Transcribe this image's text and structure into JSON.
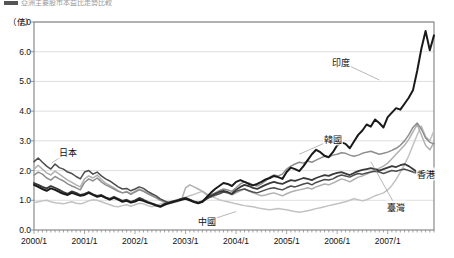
{
  "header": {
    "cut_title": "亞洲主要股市本益比走勢比較"
  },
  "chart_data": {
    "type": "line",
    "title": "",
    "unit_label": "（倍）",
    "xlabel": "",
    "ylabel": "倍",
    "ylim": [
      0.0,
      7.0
    ],
    "yticks": [
      "0.0",
      "1.0",
      "2.0",
      "3.0",
      "4.0",
      "5.0",
      "6.0",
      "7.0"
    ],
    "ytick_values": [
      0.0,
      1.0,
      2.0,
      3.0,
      4.0,
      5.0,
      6.0,
      7.0
    ],
    "xticks": [
      "2000/1",
      "2001/1",
      "2002/1",
      "2003/1",
      "2004/1",
      "2005/1",
      "2006/1",
      "2007/1"
    ],
    "xtick_values": [
      0,
      12,
      24,
      36,
      48,
      60,
      72,
      84
    ],
    "x_range": [
      0,
      95
    ],
    "x_minor_tick_interval_months": 1,
    "grid": "horizontal",
    "legend": "inline-annotations",
    "colors": {
      "japan": "#4d4d4d",
      "china": "#c2c2c2",
      "korea": "#8e8e8e",
      "hongkong": "#3a3a3a",
      "taiwan": "#b0b0b0",
      "india": "#1a1a1a",
      "axis": "#808080",
      "grid": "#d6d6d6",
      "text": "#111111"
    },
    "series": [
      {
        "name": "日本",
        "key": "japan",
        "color": "#4d4d4d",
        "width": 1.5,
        "label_x_month": 8,
        "label_y_value": 2.62,
        "leader_to_x_month": 4.2,
        "leader_to_y_value": 2.25,
        "values": [
          2.3,
          2.42,
          2.28,
          2.15,
          2.05,
          2.22,
          2.1,
          2.05,
          1.95,
          1.9,
          1.8,
          1.72,
          1.95,
          2.0,
          1.88,
          1.95,
          1.82,
          1.72,
          1.65,
          1.55,
          1.45,
          1.38,
          1.4,
          1.32,
          1.38,
          1.45,
          1.4,
          1.3,
          1.22,
          1.15,
          1.05,
          0.98,
          0.92,
          0.98,
          1.0,
          1.05,
          1.08,
          1.02,
          0.95,
          0.92,
          0.98,
          1.05,
          1.12,
          1.18,
          1.22,
          1.28,
          1.25,
          1.2,
          1.3,
          1.35,
          1.38,
          1.32,
          1.28,
          1.25,
          1.3,
          1.35,
          1.4,
          1.42,
          1.38,
          1.35,
          1.42,
          1.48,
          1.45,
          1.5,
          1.55,
          1.58,
          1.52,
          1.6,
          1.65,
          1.7,
          1.68,
          1.72,
          1.8,
          1.85,
          1.82,
          1.78,
          1.85,
          1.9,
          1.88,
          1.92,
          1.95,
          1.98,
          1.95,
          1.9,
          1.95,
          2.0,
          1.98,
          2.02,
          2.05,
          2.0,
          1.95,
          1.92,
          1.9,
          1.95,
          1.98,
          2.0
        ]
      },
      {
        "name": "中國",
        "key": "china",
        "color": "#c2c2c2",
        "width": 1.5,
        "label_x_month": 41,
        "label_y_value": 0.3,
        "leader_to_x_month": 48,
        "leader_to_y_value": 0.62,
        "values": [
          0.92,
          0.95,
          0.98,
          1.0,
          0.95,
          0.92,
          0.9,
          0.88,
          0.92,
          0.95,
          0.9,
          0.88,
          0.92,
          0.98,
          1.02,
          1.0,
          0.95,
          0.9,
          0.85,
          0.8,
          0.78,
          0.82,
          0.85,
          0.8,
          0.85,
          0.9,
          0.88,
          0.82,
          0.78,
          0.82,
          0.88,
          0.92,
          0.95,
          0.98,
          1.02,
          1.05,
          1.1,
          1.15,
          1.2,
          1.25,
          1.3,
          1.22,
          1.15,
          1.08,
          1.02,
          0.98,
          0.95,
          0.92,
          0.88,
          0.85,
          0.82,
          0.8,
          0.78,
          0.75,
          0.72,
          0.7,
          0.68,
          0.7,
          0.72,
          0.7,
          0.68,
          0.65,
          0.62,
          0.6,
          0.62,
          0.65,
          0.68,
          0.72,
          0.75,
          0.78,
          0.82,
          0.85,
          0.88,
          0.92,
          0.95,
          1.0,
          1.05,
          1.02,
          0.98,
          1.02,
          1.08,
          1.15,
          1.2,
          1.25,
          1.35,
          1.5,
          1.7,
          1.95,
          2.2,
          2.5,
          2.85,
          3.2,
          3.5,
          3.15,
          3.0,
          3.35
        ]
      },
      {
        "name": "韓國",
        "key": "korea",
        "color": "#8e8e8e",
        "width": 1.5,
        "label_x_month": 71,
        "label_y_value": 3.05,
        "leader_to_x_month": 63,
        "leader_to_y_value": 2.55,
        "values": [
          1.85,
          1.95,
          1.88,
          1.75,
          1.68,
          1.8,
          1.72,
          1.65,
          1.55,
          1.48,
          1.42,
          1.35,
          1.6,
          1.72,
          1.65,
          1.75,
          1.62,
          1.52,
          1.45,
          1.38,
          1.3,
          1.25,
          1.28,
          1.2,
          1.28,
          1.35,
          1.3,
          1.22,
          1.15,
          1.08,
          1.0,
          0.95,
          0.9,
          0.95,
          0.98,
          1.02,
          1.05,
          1.0,
          0.95,
          0.92,
          0.98,
          1.08,
          1.18,
          1.25,
          1.32,
          1.38,
          1.35,
          1.3,
          1.42,
          1.55,
          1.62,
          1.58,
          1.52,
          1.48,
          1.55,
          1.65,
          1.78,
          1.85,
          1.82,
          1.88,
          2.05,
          2.15,
          2.22,
          2.28,
          2.25,
          2.32,
          2.28,
          2.35,
          2.42,
          2.48,
          2.45,
          2.52,
          2.55,
          2.6,
          2.58,
          2.52,
          2.48,
          2.52,
          2.58,
          2.62,
          2.65,
          2.6,
          2.55,
          2.58,
          2.62,
          2.68,
          2.75,
          2.85,
          3.0,
          3.2,
          3.45,
          3.6,
          3.4,
          3.1,
          2.95,
          2.9
        ]
      },
      {
        "name": "香港",
        "key": "hongkong",
        "color": "#3a3a3a",
        "width": 1.8,
        "label_x_month": 93,
        "label_y_value": 1.9,
        "leader_to_x_month": 90,
        "leader_to_y_value": 1.92,
        "values": [
          1.58,
          1.52,
          1.45,
          1.4,
          1.48,
          1.42,
          1.35,
          1.28,
          1.22,
          1.3,
          1.25,
          1.18,
          1.22,
          1.28,
          1.2,
          1.15,
          1.18,
          1.1,
          1.05,
          1.12,
          1.05,
          0.98,
          1.02,
          0.95,
          1.0,
          1.08,
          1.02,
          0.95,
          0.9,
          0.85,
          0.8,
          0.88,
          0.92,
          0.95,
          1.0,
          1.05,
          1.08,
          1.02,
          0.96,
          0.92,
          0.95,
          1.05,
          1.15,
          1.22,
          1.28,
          1.32,
          1.28,
          1.22,
          1.35,
          1.45,
          1.52,
          1.48,
          1.42,
          1.38,
          1.45,
          1.52,
          1.58,
          1.62,
          1.58,
          1.55,
          1.62,
          1.68,
          1.65,
          1.7,
          1.75,
          1.72,
          1.68,
          1.75,
          1.8,
          1.85,
          1.82,
          1.88,
          1.92,
          1.95,
          1.9,
          1.85,
          1.92,
          1.98,
          2.02,
          2.05,
          2.08,
          2.05,
          2.0,
          2.05,
          2.1,
          2.15,
          2.12,
          2.18,
          2.22,
          2.15,
          2.05,
          1.95,
          1.9,
          1.92,
          1.95,
          1.98
        ]
      },
      {
        "name": "臺灣",
        "key": "taiwan",
        "color": "#b0b0b0",
        "width": 1.5,
        "label_x_month": 86,
        "label_y_value": 0.78,
        "leader_to_x_month": 80,
        "leader_to_y_value": 2.3,
        "values": [
          2.05,
          2.18,
          2.05,
          1.92,
          1.85,
          1.98,
          1.88,
          1.78,
          1.68,
          1.6,
          1.52,
          1.45,
          1.72,
          1.82,
          1.75,
          1.85,
          1.7,
          1.58,
          1.5,
          1.42,
          1.32,
          1.25,
          1.3,
          1.22,
          1.3,
          1.38,
          1.32,
          1.25,
          1.18,
          1.1,
          1.02,
          0.95,
          0.88,
          0.92,
          0.95,
          1.0,
          1.42,
          1.52,
          1.45,
          1.38,
          1.3,
          1.18,
          1.1,
          1.15,
          1.22,
          1.28,
          1.25,
          1.18,
          1.25,
          1.32,
          1.38,
          1.32,
          1.25,
          1.2,
          1.15,
          1.18,
          1.22,
          1.25,
          1.2,
          1.15,
          1.22,
          1.28,
          1.32,
          1.35,
          1.38,
          1.42,
          1.38,
          1.45,
          1.5,
          1.55,
          1.52,
          1.58,
          1.65,
          1.72,
          1.68,
          1.62,
          1.7,
          1.78,
          1.82,
          1.88,
          1.95,
          2.02,
          2.08,
          2.15,
          2.25,
          2.4,
          2.55,
          2.7,
          2.85,
          3.05,
          3.3,
          3.55,
          3.2,
          2.85,
          2.7,
          2.95
        ]
      },
      {
        "name": "印度",
        "key": "india",
        "color": "#1a1a1a",
        "width": 2.0,
        "label_x_month": 73,
        "label_y_value": 5.65,
        "leader_to_x_month": 82,
        "leader_to_y_value": 5.05,
        "values": [
          1.52,
          1.45,
          1.38,
          1.32,
          1.4,
          1.35,
          1.28,
          1.22,
          1.18,
          1.25,
          1.2,
          1.15,
          1.18,
          1.25,
          1.18,
          1.12,
          1.15,
          1.08,
          1.02,
          1.08,
          1.02,
          0.95,
          0.98,
          0.92,
          0.96,
          1.02,
          0.98,
          0.92,
          0.88,
          0.82,
          0.78,
          0.85,
          0.9,
          0.94,
          0.98,
          1.02,
          1.05,
          1.0,
          0.94,
          0.9,
          0.95,
          1.1,
          1.25,
          1.38,
          1.48,
          1.58,
          1.55,
          1.48,
          1.62,
          1.68,
          1.62,
          1.55,
          1.5,
          1.55,
          1.62,
          1.7,
          1.75,
          1.82,
          1.78,
          1.72,
          1.95,
          2.1,
          2.05,
          1.98,
          2.15,
          2.35,
          2.55,
          2.7,
          2.62,
          2.5,
          2.45,
          2.62,
          2.85,
          2.95,
          2.9,
          2.75,
          2.98,
          3.2,
          3.35,
          3.55,
          3.48,
          3.72,
          3.6,
          3.45,
          3.8,
          3.95,
          4.1,
          4.05,
          4.25,
          4.45,
          4.7,
          5.35,
          6.1,
          6.7,
          6.05,
          6.55
        ]
      }
    ],
    "annotations": [
      {
        "text": "日本",
        "x_month": 8,
        "y_value": 2.62
      },
      {
        "text": "中國",
        "x_month": 41,
        "y_value": 0.3
      },
      {
        "text": "韓國",
        "x_month": 71,
        "y_value": 3.05
      },
      {
        "text": "香港",
        "x_month": 93,
        "y_value": 1.9
      },
      {
        "text": "臺灣",
        "x_month": 86,
        "y_value": 0.78
      },
      {
        "text": "印度",
        "x_month": 73,
        "y_value": 5.65
      }
    ]
  }
}
